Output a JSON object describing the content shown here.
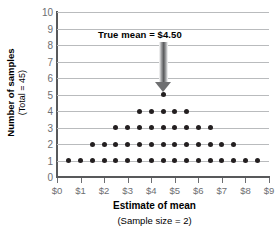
{
  "chart_data": {
    "type": "scatter",
    "title": "",
    "xlabel": "Estimate of mean",
    "xsublabel": "(Sample size = 2)",
    "ylabel": "Number of samples",
    "ysublabel": "(Total = 45)",
    "xlim": [
      0,
      9
    ],
    "ylim": [
      0,
      10
    ],
    "grid": true,
    "legend": "none",
    "x_tick_labels": [
      "$0",
      "$1",
      "$2",
      "$3",
      "$4",
      "$5",
      "$6",
      "$7",
      "$8",
      "$9"
    ],
    "x_tick_values": [
      0,
      1,
      2,
      3,
      4,
      5,
      6,
      7,
      8,
      9
    ],
    "y_tick_labels": [
      "0",
      "1",
      "2",
      "3",
      "4",
      "5",
      "6",
      "7",
      "8",
      "9",
      "10"
    ],
    "y_tick_values": [
      0,
      1,
      2,
      3,
      4,
      5,
      6,
      7,
      8,
      9,
      10
    ],
    "gridline_values": [
      1,
      2,
      3,
      4,
      5,
      6,
      7,
      8,
      9,
      10
    ],
    "dot_color": "#231f20",
    "axis_color": "#58595b",
    "grid_color": "#b9bbbd",
    "tick_label_color": "#6d6e71",
    "points": [
      {
        "x": 0.5,
        "y": 1
      },
      {
        "x": 1.0,
        "y": 1
      },
      {
        "x": 1.5,
        "y": 1
      },
      {
        "x": 2.0,
        "y": 1
      },
      {
        "x": 2.5,
        "y": 1
      },
      {
        "x": 3.0,
        "y": 1
      },
      {
        "x": 3.5,
        "y": 1
      },
      {
        "x": 4.0,
        "y": 1
      },
      {
        "x": 4.5,
        "y": 1
      },
      {
        "x": 5.0,
        "y": 1
      },
      {
        "x": 5.5,
        "y": 1
      },
      {
        "x": 6.0,
        "y": 1
      },
      {
        "x": 6.5,
        "y": 1
      },
      {
        "x": 7.0,
        "y": 1
      },
      {
        "x": 7.5,
        "y": 1
      },
      {
        "x": 8.0,
        "y": 1
      },
      {
        "x": 8.5,
        "y": 1
      },
      {
        "x": 1.5,
        "y": 2
      },
      {
        "x": 2.0,
        "y": 2
      },
      {
        "x": 2.5,
        "y": 2
      },
      {
        "x": 3.0,
        "y": 2
      },
      {
        "x": 3.5,
        "y": 2
      },
      {
        "x": 4.0,
        "y": 2
      },
      {
        "x": 4.5,
        "y": 2
      },
      {
        "x": 5.0,
        "y": 2
      },
      {
        "x": 5.5,
        "y": 2
      },
      {
        "x": 6.0,
        "y": 2
      },
      {
        "x": 6.5,
        "y": 2
      },
      {
        "x": 7.0,
        "y": 2
      },
      {
        "x": 7.5,
        "y": 2
      },
      {
        "x": 2.5,
        "y": 3
      },
      {
        "x": 3.0,
        "y": 3
      },
      {
        "x": 3.5,
        "y": 3
      },
      {
        "x": 4.0,
        "y": 3
      },
      {
        "x": 4.5,
        "y": 3
      },
      {
        "x": 5.0,
        "y": 3
      },
      {
        "x": 5.5,
        "y": 3
      },
      {
        "x": 6.0,
        "y": 3
      },
      {
        "x": 6.5,
        "y": 3
      },
      {
        "x": 3.5,
        "y": 4
      },
      {
        "x": 4.0,
        "y": 4
      },
      {
        "x": 4.5,
        "y": 4
      },
      {
        "x": 5.0,
        "y": 4
      },
      {
        "x": 5.5,
        "y": 4
      },
      {
        "x": 4.5,
        "y": 5
      }
    ],
    "annotations": [
      {
        "text": "True mean  =  $4.50",
        "x": 4.5,
        "arrow": "down",
        "arrow_color": "#58595b"
      }
    ]
  }
}
